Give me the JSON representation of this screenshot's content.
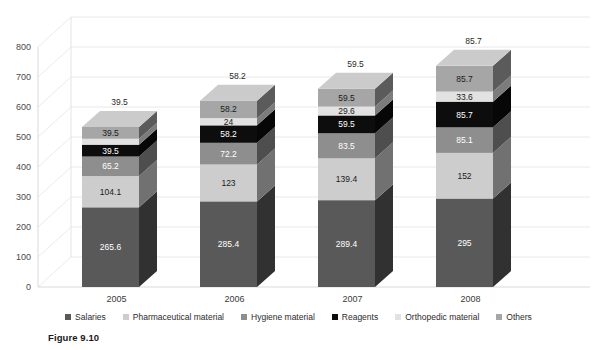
{
  "figure": {
    "caption": "Figure 9.10"
  },
  "legend": {
    "position": "bottom",
    "items": [
      {
        "label": "Salaries",
        "color": "#595959"
      },
      {
        "label": "Pharmaceutical material",
        "color": "#cdcdcd"
      },
      {
        "label": "Hygiene material",
        "color": "#8e8e8e"
      },
      {
        "label": "Reagents",
        "color": "#0d0d0d"
      },
      {
        "label": "Orthopedic material",
        "color": "#e2e2e2"
      },
      {
        "label": "Others",
        "color": "#a6a6a6"
      }
    ]
  },
  "axes": {
    "y_ticks": [
      "0",
      "100",
      "200",
      "300",
      "400",
      "500",
      "600",
      "700",
      "800"
    ],
    "x_ticks": [
      "2005",
      "2006",
      "2007",
      "2008"
    ]
  },
  "chart_data": {
    "type": "bar",
    "subtype": "stacked-3d-column",
    "title": "",
    "xlabel": "",
    "ylabel": "",
    "ylim": [
      0,
      800
    ],
    "ytick_step": 100,
    "grid": true,
    "legend_position": "bottom",
    "categories": [
      "2005",
      "2006",
      "2007",
      "2008"
    ],
    "series": [
      {
        "name": "Salaries",
        "color": "#595959",
        "values": [
          265.6,
          285.4,
          289.4,
          295
        ]
      },
      {
        "name": "Pharmaceutical material",
        "color": "#cdcdcd",
        "values": [
          104.1,
          123,
          139.4,
          152
        ]
      },
      {
        "name": "Hygiene material",
        "color": "#8e8e8e",
        "values": [
          65.2,
          72.2,
          83.5,
          85.1
        ]
      },
      {
        "name": "Reagents",
        "color": "#0d0d0d",
        "values": [
          39.5,
          58.2,
          59.5,
          85.7
        ]
      },
      {
        "name": "Orthopedic material",
        "color": "#e2e2e2",
        "values": [
          19.7,
          24,
          29.6,
          33.6
        ]
      },
      {
        "name": "Others",
        "color": "#a6a6a6",
        "values": [
          39.5,
          58.2,
          59.5,
          85.7
        ]
      }
    ],
    "top_labels": [
      "39.5",
      "58.2",
      "59.5",
      "85.7"
    ],
    "segment_labels": {
      "2005": [
        "265.6",
        "104.1",
        "65.2",
        "39.5",
        "19.7",
        "39.5"
      ],
      "2006": [
        "285.4",
        "123",
        "72.2",
        "58.2",
        "24",
        "58.2"
      ],
      "2007": [
        "289.4",
        "139.4",
        "83.5",
        "59.5",
        "29.6",
        "59.5"
      ],
      "2008": [
        "295",
        "152",
        "85.1",
        "85.7",
        "33.6",
        "85.7"
      ]
    }
  }
}
